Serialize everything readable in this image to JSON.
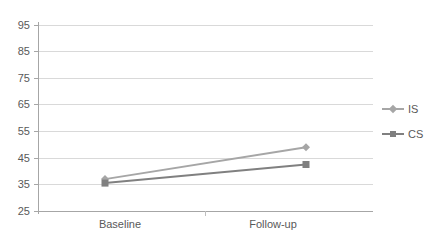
{
  "chart_data": {
    "type": "line",
    "title": "",
    "xlabel": "",
    "ylabel": "",
    "categories": [
      "Baseline",
      "Follow-up"
    ],
    "series": [
      {
        "name": "IS",
        "values": [
          37,
          49
        ],
        "color": "#a6a6a6",
        "marker": "diamond"
      },
      {
        "name": "CS",
        "values": [
          35.5,
          42.5
        ],
        "color": "#808080",
        "marker": "square"
      }
    ],
    "ylim": [
      25,
      95
    ],
    "ytick_values": [
      25,
      35,
      45,
      55,
      65,
      75,
      85,
      95
    ],
    "ytick_labels": [
      "25",
      "35",
      "45",
      "55",
      "65",
      "75",
      "85",
      "95"
    ],
    "grid": true,
    "legend_position": "right"
  },
  "legend": {
    "entries": [
      {
        "label": "IS"
      },
      {
        "label": "CS"
      }
    ]
  },
  "axes": {
    "x_categories": [
      "Baseline",
      "Follow-up"
    ],
    "y_labels": [
      "95",
      "85",
      "75",
      "65",
      "55",
      "45",
      "35",
      "25"
    ]
  },
  "colors": {
    "series_is": "#a6a6a6",
    "series_cs": "#808080",
    "gridline": "#d9d9d9",
    "axis": "#a6a6a6",
    "text": "#595959",
    "background": "#ffffff"
  }
}
